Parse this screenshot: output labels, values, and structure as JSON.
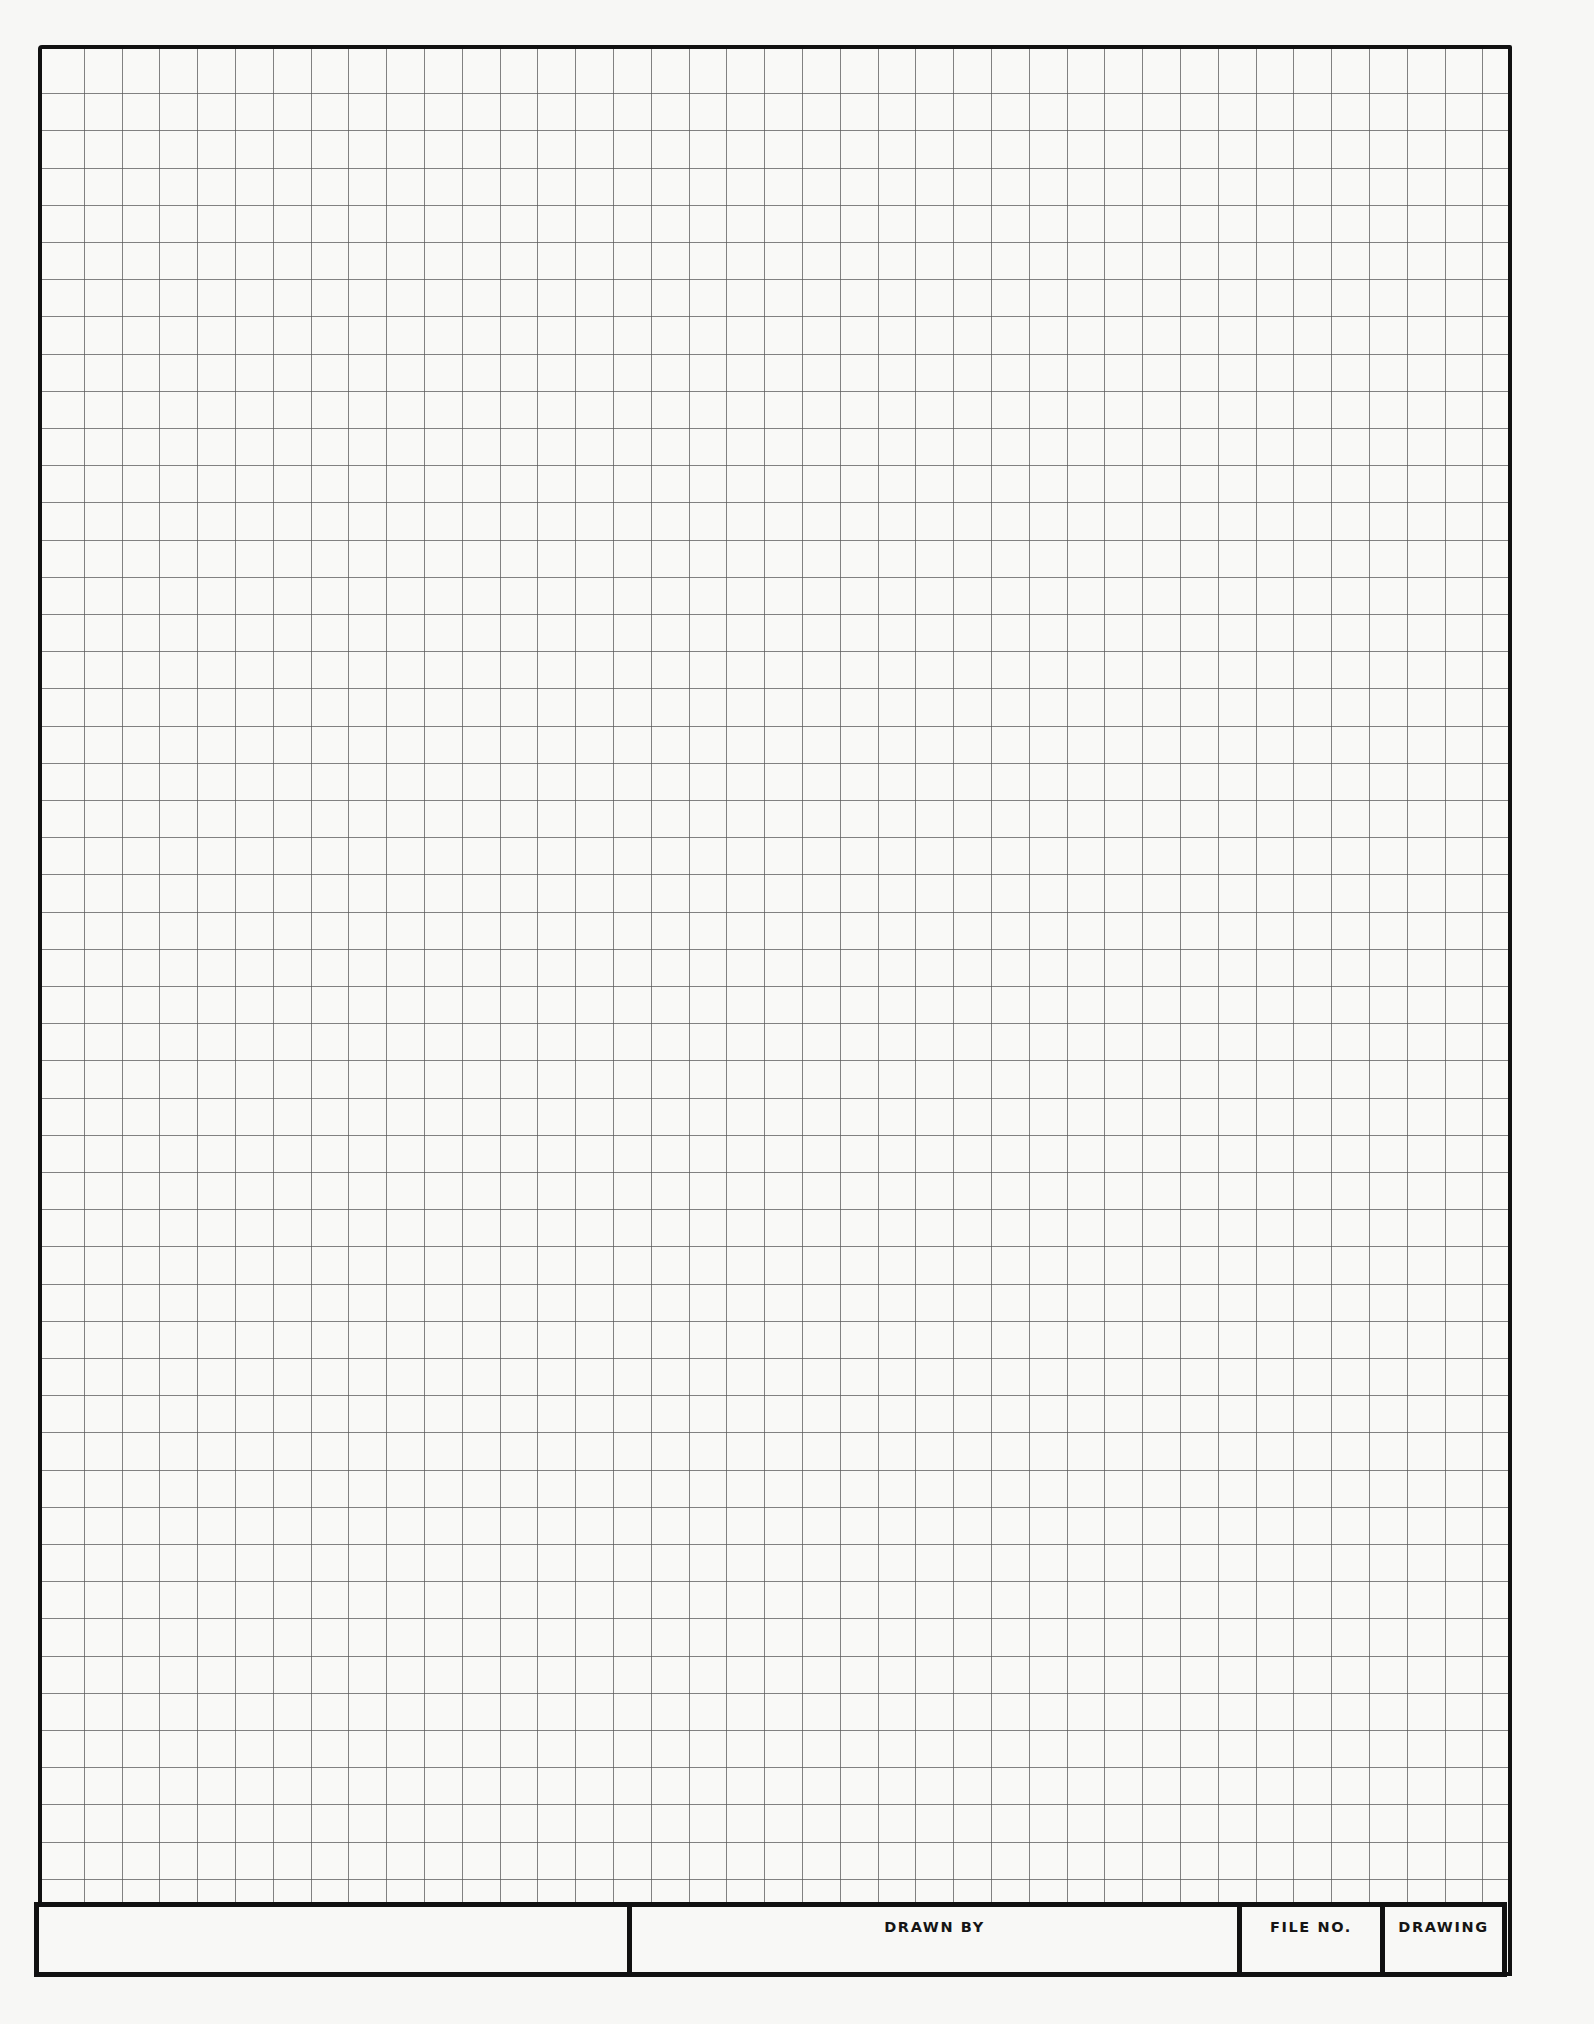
{
  "document": {
    "type": "graph paper drawing sheet",
    "grid": {
      "columns": 39,
      "rows": 50,
      "line_color": "#5a5a5a",
      "border_color": "#111111",
      "paper_color": "#f7f7f5"
    }
  },
  "title_block": {
    "cells": [
      {
        "label": ""
      },
      {
        "label": "DRAWN BY"
      },
      {
        "label": "FILE NO."
      },
      {
        "label": "DRAWING"
      }
    ]
  }
}
